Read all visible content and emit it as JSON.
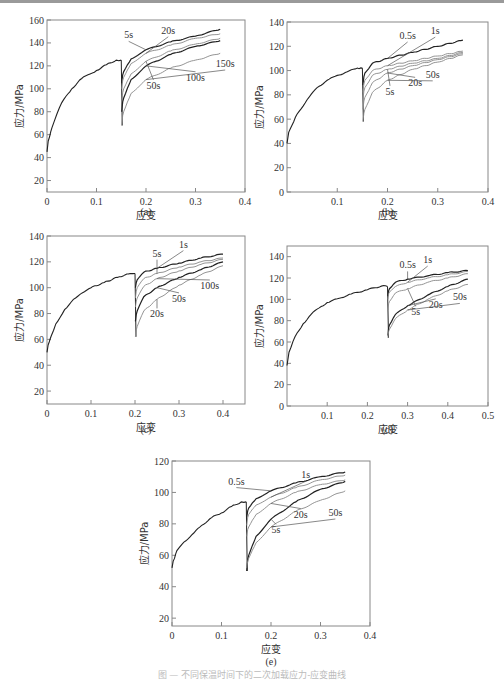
{
  "figure": {
    "caption": "图 — 不同保温时间下的二次加载应力-应变曲线"
  },
  "chart_data": [
    {
      "id": "a",
      "label": "(a)",
      "type": "line",
      "xlabel": "应变",
      "ylabel": "应力/MPa",
      "xlim": [
        0,
        0.4
      ],
      "ylim": [
        10,
        160
      ],
      "xticks": [
        0,
        0.1,
        0.2,
        0.3,
        0.4
      ],
      "yticks": [
        20,
        40,
        60,
        80,
        100,
        120,
        140,
        160
      ],
      "unload_strain": 0.15,
      "preload": {
        "x": [
          0,
          0.005,
          0.01,
          0.02,
          0.03,
          0.05,
          0.07,
          0.1,
          0.12,
          0.14,
          0.15
        ],
        "y": [
          45,
          58,
          66,
          78,
          88,
          100,
          109,
          116,
          121,
          125,
          125
        ]
      },
      "series": [
        {
          "name": "5s",
          "x": [
            0.151,
            0.155,
            0.17,
            0.2,
            0.25,
            0.3,
            0.35
          ],
          "y": [
            105,
            115,
            126,
            134,
            141,
            146,
            152
          ]
        },
        {
          "name": "20s",
          "x": [
            0.151,
            0.155,
            0.17,
            0.2,
            0.25,
            0.3,
            0.35
          ],
          "y": [
            100,
            110,
            122,
            131,
            138,
            144,
            148
          ]
        },
        {
          "name": "50s",
          "x": [
            0.151,
            0.155,
            0.17,
            0.2,
            0.25,
            0.3,
            0.35
          ],
          "y": [
            88,
            100,
            113,
            124,
            133,
            139,
            144
          ]
        },
        {
          "name": "100s",
          "x": [
            0.151,
            0.155,
            0.17,
            0.2,
            0.25,
            0.3,
            0.35
          ],
          "y": [
            80,
            92,
            108,
            120,
            130,
            137,
            142
          ]
        },
        {
          "name": "150s",
          "x": [
            0.151,
            0.155,
            0.17,
            0.2,
            0.25,
            0.3,
            0.35
          ],
          "y": [
            68,
            80,
            96,
            108,
            118,
            125,
            131
          ]
        }
      ],
      "annotations": [
        {
          "text": "5s",
          "x": 0.165,
          "y": 144
        },
        {
          "text": "20s",
          "x": 0.245,
          "y": 148
        },
        {
          "text": "50s",
          "x": 0.215,
          "y": 100
        },
        {
          "text": "100s",
          "x": 0.3,
          "y": 107
        },
        {
          "text": "150s",
          "x": 0.36,
          "y": 119
        }
      ]
    },
    {
      "id": "b",
      "label": "(b)",
      "type": "line",
      "xlabel": "应变",
      "ylabel": "应力/MPa",
      "xlim": [
        0,
        0.4
      ],
      "ylim": [
        0,
        140
      ],
      "xticks": [
        0.1,
        0.2,
        0.3,
        0.4
      ],
      "yticks": [
        0,
        20,
        40,
        60,
        80,
        100,
        120,
        140
      ],
      "unload_strain": 0.15,
      "preload": {
        "x": [
          0,
          0.01,
          0.02,
          0.04,
          0.06,
          0.08,
          0.1,
          0.12,
          0.14,
          0.15
        ],
        "y": [
          40,
          55,
          64,
          76,
          86,
          92,
          96,
          99,
          102,
          102
        ]
      },
      "series": [
        {
          "name": "0.5s",
          "x": [
            0.151,
            0.155,
            0.17,
            0.2,
            0.25,
            0.3,
            0.35
          ],
          "y": [
            88,
            98,
            106,
            110,
            115,
            120,
            125
          ]
        },
        {
          "name": "1s",
          "x": [
            0.151,
            0.155,
            0.17,
            0.2,
            0.25,
            0.3,
            0.35
          ],
          "y": [
            82,
            92,
            100,
            104,
            108,
            112,
            116
          ]
        },
        {
          "name": "5s",
          "x": [
            0.151,
            0.155,
            0.17,
            0.2,
            0.25,
            0.3,
            0.35
          ],
          "y": [
            76,
            86,
            96,
            101,
            106,
            110,
            115
          ]
        },
        {
          "name": "20s",
          "x": [
            0.151,
            0.155,
            0.17,
            0.2,
            0.25,
            0.3,
            0.35
          ],
          "y": [
            68,
            78,
            90,
            98,
            104,
            109,
            114
          ]
        },
        {
          "name": "50s",
          "x": [
            0.151,
            0.155,
            0.17,
            0.2,
            0.25,
            0.3,
            0.35
          ],
          "y": [
            58,
            68,
            82,
            92,
            101,
            107,
            113
          ]
        }
      ],
      "annotations": [
        {
          "text": "0.5s",
          "x": 0.24,
          "y": 126
        },
        {
          "text": "1s",
          "x": 0.295,
          "y": 130
        },
        {
          "text": "5s",
          "x": 0.205,
          "y": 80
        },
        {
          "text": "20s",
          "x": 0.255,
          "y": 87
        },
        {
          "text": "50s",
          "x": 0.29,
          "y": 94
        }
      ]
    },
    {
      "id": "c",
      "label": "(c)",
      "type": "line",
      "xlabel": "应变",
      "ylabel": "应力/MPa",
      "xlim": [
        0,
        0.45
      ],
      "ylim": [
        10,
        140
      ],
      "xticks": [
        0,
        0.1,
        0.2,
        0.3,
        0.4
      ],
      "yticks": [
        20,
        40,
        60,
        80,
        100,
        120,
        140
      ],
      "unload_strain": 0.2,
      "preload": {
        "x": [
          0,
          0.005,
          0.01,
          0.02,
          0.04,
          0.06,
          0.08,
          0.1,
          0.13,
          0.16,
          0.19,
          0.2
        ],
        "y": [
          50,
          58,
          63,
          72,
          83,
          91,
          96,
          100,
          104,
          108,
          111,
          111
        ]
      },
      "series": [
        {
          "name": "1s",
          "x": [
            0.201,
            0.205,
            0.22,
            0.25,
            0.3,
            0.35,
            0.4
          ],
          "y": [
            100,
            106,
            112,
            115,
            119,
            123,
            126
          ]
        },
        {
          "name": "5s",
          "x": [
            0.201,
            0.205,
            0.22,
            0.25,
            0.3,
            0.35,
            0.4
          ],
          "y": [
            92,
            100,
            107,
            111,
            116,
            120,
            123
          ]
        },
        {
          "name": "100s",
          "x": [
            0.201,
            0.205,
            0.22,
            0.25,
            0.3,
            0.35,
            0.4
          ],
          "y": [
            85,
            92,
            101,
            107,
            113,
            118,
            122
          ]
        },
        {
          "name": "50s",
          "x": [
            0.201,
            0.205,
            0.22,
            0.25,
            0.3,
            0.35,
            0.4
          ],
          "y": [
            74,
            82,
            93,
            100,
            108,
            114,
            120
          ]
        },
        {
          "name": "20s",
          "x": [
            0.201,
            0.205,
            0.22,
            0.25,
            0.3,
            0.35,
            0.4
          ],
          "y": [
            62,
            70,
            82,
            91,
            102,
            110,
            117
          ]
        }
      ],
      "annotations": [
        {
          "text": "1s",
          "x": 0.31,
          "y": 131
        },
        {
          "text": "5s",
          "x": 0.25,
          "y": 124
        },
        {
          "text": "100s",
          "x": 0.37,
          "y": 99
        },
        {
          "text": "50s",
          "x": 0.3,
          "y": 89
        },
        {
          "text": "20s",
          "x": 0.25,
          "y": 77
        }
      ]
    },
    {
      "id": "d",
      "label": "(d)",
      "type": "line",
      "xlabel": "应变",
      "ylabel": "应力/MPa",
      "xlim": [
        0,
        0.5
      ],
      "ylim": [
        0,
        150
      ],
      "xticks": [
        0.1,
        0.2,
        0.3,
        0.4,
        0.5
      ],
      "yticks": [
        0,
        20,
        40,
        60,
        80,
        100,
        120,
        140
      ],
      "unload_strain": 0.25,
      "preload": {
        "x": [
          0,
          0.01,
          0.02,
          0.04,
          0.06,
          0.08,
          0.1,
          0.13,
          0.16,
          0.2,
          0.24,
          0.25
        ],
        "y": [
          38,
          55,
          65,
          77,
          86,
          92,
          97,
          101,
          105,
          109,
          113,
          112
        ]
      },
      "series": [
        {
          "name": "0.5s",
          "x": [
            0.251,
            0.255,
            0.27,
            0.3,
            0.35,
            0.4,
            0.45
          ],
          "y": [
            103,
            110,
            116,
            119,
            122,
            125,
            127
          ]
        },
        {
          "name": "1s",
          "x": [
            0.251,
            0.255,
            0.27,
            0.3,
            0.35,
            0.4,
            0.45
          ],
          "y": [
            100,
            107,
            112,
            116,
            120,
            123,
            126
          ]
        },
        {
          "name": "5s",
          "x": [
            0.251,
            0.255,
            0.27,
            0.3,
            0.35,
            0.4,
            0.45
          ],
          "y": [
            90,
            98,
            106,
            110,
            116,
            120,
            124
          ]
        },
        {
          "name": "20s",
          "x": [
            0.251,
            0.255,
            0.27,
            0.3,
            0.35,
            0.4,
            0.45
          ],
          "y": [
            66,
            76,
            86,
            94,
            104,
            112,
            119
          ]
        },
        {
          "name": "50s",
          "x": [
            0.251,
            0.255,
            0.27,
            0.3,
            0.35,
            0.4,
            0.45
          ],
          "y": [
            64,
            72,
            82,
            90,
            100,
            108,
            114
          ]
        }
      ],
      "annotations": [
        {
          "text": "0.5s",
          "x": 0.3,
          "y": 129
        },
        {
          "text": "1s",
          "x": 0.35,
          "y": 134
        },
        {
          "text": "5s",
          "x": 0.32,
          "y": 85
        },
        {
          "text": "20s",
          "x": 0.37,
          "y": 92
        },
        {
          "text": "50s",
          "x": 0.43,
          "y": 99
        }
      ]
    },
    {
      "id": "e",
      "label": "(e)",
      "type": "line",
      "xlabel": "应变",
      "ylabel": "应力/MPa",
      "xlim": [
        0,
        0.4
      ],
      "ylim": [
        15,
        120
      ],
      "xticks": [
        0,
        0.1,
        0.2,
        0.3,
        0.4
      ],
      "yticks": [
        20,
        40,
        60,
        80,
        100,
        120
      ],
      "unload_strain": 0.15,
      "preload": {
        "x": [
          0,
          0.005,
          0.01,
          0.02,
          0.04,
          0.06,
          0.08,
          0.1,
          0.12,
          0.14,
          0.15
        ],
        "y": [
          52,
          58,
          63,
          67,
          73,
          79,
          84,
          87,
          91,
          94,
          94
        ]
      },
      "series": [
        {
          "name": "0.5s",
          "x": [
            0.151,
            0.155,
            0.17,
            0.2,
            0.25,
            0.3,
            0.35
          ],
          "y": [
            84,
            90,
            96,
            101,
            106,
            110,
            113
          ]
        },
        {
          "name": "1s",
          "x": [
            0.151,
            0.155,
            0.17,
            0.2,
            0.25,
            0.3,
            0.35
          ],
          "y": [
            79,
            86,
            92,
            97,
            103,
            108,
            111
          ]
        },
        {
          "name": "20s",
          "x": [
            0.151,
            0.155,
            0.17,
            0.2,
            0.25,
            0.3,
            0.35
          ],
          "y": [
            72,
            78,
            86,
            93,
            100,
            105,
            108
          ]
        },
        {
          "name": "5s",
          "x": [
            0.151,
            0.155,
            0.17,
            0.2,
            0.25,
            0.3,
            0.35
          ],
          "y": [
            50,
            60,
            72,
            83,
            94,
            102,
            107
          ]
        },
        {
          "name": "50s",
          "x": [
            0.151,
            0.155,
            0.17,
            0.2,
            0.25,
            0.3,
            0.35
          ],
          "y": [
            52,
            58,
            68,
            78,
            88,
            95,
            101
          ]
        }
      ],
      "annotations": [
        {
          "text": "0.5s",
          "x": 0.13,
          "y": 105
        },
        {
          "text": "1s",
          "x": 0.27,
          "y": 109
        },
        {
          "text": "20s",
          "x": 0.26,
          "y": 84
        },
        {
          "text": "5s",
          "x": 0.21,
          "y": 74
        },
        {
          "text": "50s",
          "x": 0.33,
          "y": 85
        }
      ]
    }
  ],
  "panels_layout": [
    {
      "id": "a",
      "left": 47,
      "top": 20,
      "width": 198,
      "height": 172,
      "label_top": 206
    },
    {
      "id": "b",
      "left": 287,
      "top": 22,
      "width": 201,
      "height": 170,
      "label_top": 206
    },
    {
      "id": "c",
      "left": 47,
      "top": 236,
      "width": 198,
      "height": 168,
      "label_top": 424
    },
    {
      "id": "d",
      "left": 287,
      "top": 246,
      "width": 201,
      "height": 160,
      "label_top": 424
    },
    {
      "id": "e",
      "left": 172,
      "top": 461,
      "width": 198,
      "height": 165,
      "label_top": 656
    }
  ],
  "colors": {
    "axis": "#888888",
    "curve_dark": "#222222",
    "curve_light": "#888888",
    "leader": "#555555"
  }
}
